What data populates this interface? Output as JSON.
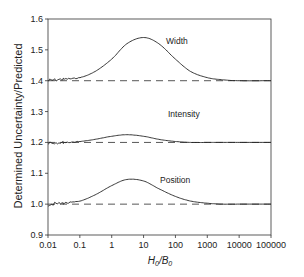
{
  "chart_data": {
    "type": "line",
    "title": "",
    "xlabel": "H0/B0",
    "ylabel": "Determined Uncertainty/Predicted",
    "xscale": "log",
    "xlim": [
      0.01,
      100000
    ],
    "ylim": [
      0.9,
      1.6
    ],
    "x_ticks": [
      "0.01",
      "0.1",
      "1",
      "10",
      "100",
      "1000",
      "10000",
      "100000"
    ],
    "y_ticks": [
      "0.9",
      "1.0",
      "1.1",
      "1.2",
      "1.3",
      "1.4",
      "1.5",
      "1.6"
    ],
    "grid": false,
    "legend": "none (inline labels)",
    "annotations": [
      "Width",
      "Intensity",
      "Position"
    ],
    "reference_lines": [
      {
        "name": "Width baseline",
        "y": 1.4,
        "style": "dashed"
      },
      {
        "name": "Intensity baseline",
        "y": 1.2,
        "style": "dashed"
      },
      {
        "name": "Position baseline",
        "y": 1.0,
        "style": "dashed"
      }
    ],
    "x": [
      0.01,
      0.03,
      0.1,
      0.3,
      1,
      3,
      10,
      30,
      100,
      300,
      1000,
      3000,
      10000,
      100000
    ],
    "series": [
      {
        "name": "Width",
        "values": [
          1.4,
          1.405,
          1.41,
          1.43,
          1.47,
          1.52,
          1.54,
          1.52,
          1.47,
          1.43,
          1.41,
          1.403,
          1.4,
          1.4
        ]
      },
      {
        "name": "Intensity",
        "values": [
          1.2,
          1.2,
          1.203,
          1.21,
          1.22,
          1.225,
          1.22,
          1.21,
          1.203,
          1.2,
          1.2,
          1.2,
          1.2,
          1.2
        ]
      },
      {
        "name": "Position",
        "values": [
          1.0,
          1.003,
          1.01,
          1.03,
          1.06,
          1.08,
          1.075,
          1.05,
          1.025,
          1.01,
          1.003,
          1.0,
          1.0,
          1.0
        ]
      }
    ]
  },
  "labels": {
    "ylabel": "Determined Uncertainty/Predicted",
    "xlabel_main": "H",
    "xlabel_sub1": "0",
    "xlabel_sep": "/B",
    "xlabel_sub2": "0",
    "width": "Width",
    "intensity": "Intensity",
    "position": "Position"
  }
}
